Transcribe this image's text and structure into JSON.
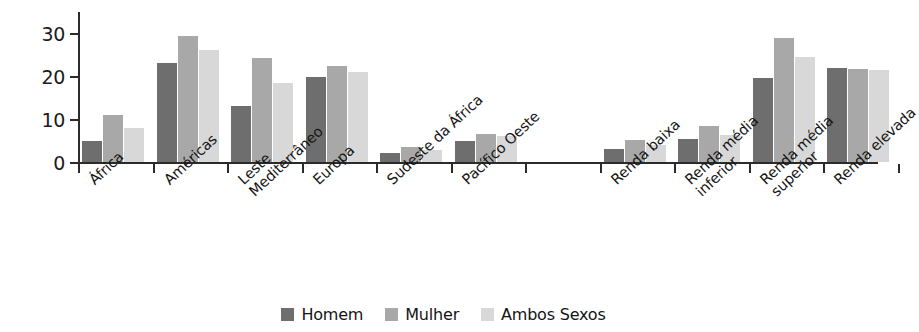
{
  "chart_data": {
    "type": "bar",
    "title": "",
    "xlabel": "",
    "ylabel": "Percentual",
    "ylim": [
      0,
      35
    ],
    "yticks": [
      0,
      10,
      20,
      30
    ],
    "grid": false,
    "legend_position": "bottom",
    "categories": [
      "África",
      "Américas",
      "Leste Mediterrâneo",
      "Europa",
      "Sudeste da África",
      "Pacífico Oeste",
      "",
      "Renda baixa",
      "Renda média inferior",
      "Renda média superior",
      "Renda elevada"
    ],
    "category_lines": [
      [
        "África"
      ],
      [
        "Américas"
      ],
      [
        "Leste",
        "Mediterrâneo"
      ],
      [
        "Europa"
      ],
      [
        "Sudeste da África"
      ],
      [
        "Pacífico Oeste"
      ],
      [
        ""
      ],
      [
        "Renda baixa"
      ],
      [
        "Renda média",
        "inferior"
      ],
      [
        "Renda média",
        "superior"
      ],
      [
        "Renda elevada"
      ]
    ],
    "series": [
      {
        "name": "Homem",
        "color": "#6e6e6e",
        "values": [
          5.0,
          23.0,
          13.0,
          19.8,
          2.0,
          5.0,
          null,
          3.0,
          5.3,
          19.5,
          22.0
        ]
      },
      {
        "name": "Mulher",
        "color": "#a8a8a8",
        "values": [
          11.0,
          29.4,
          24.2,
          22.3,
          3.5,
          6.6,
          null,
          5.2,
          8.3,
          28.9,
          21.8
        ]
      },
      {
        "name": "Ambos Sexos",
        "color": "#d8d8d8",
        "values": [
          8.0,
          26.2,
          18.4,
          21.0,
          2.7,
          6.0,
          null,
          4.0,
          6.2,
          24.5,
          21.5
        ]
      }
    ]
  },
  "axis": {
    "y_title": "Percentual",
    "ytick_labels": [
      "30",
      "20",
      "10",
      "0"
    ]
  },
  "legend": {
    "items": [
      {
        "label": "Homem",
        "color": "#6e6e6e"
      },
      {
        "label": "Mulher",
        "color": "#a8a8a8"
      },
      {
        "label": "Ambos Sexos",
        "color": "#d8d8d8"
      }
    ]
  }
}
